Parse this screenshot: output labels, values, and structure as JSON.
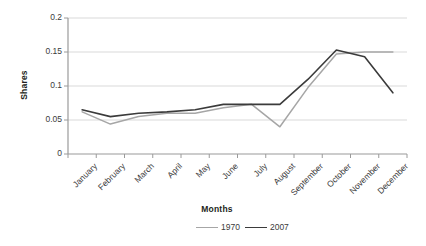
{
  "chart_data": {
    "type": "line",
    "title": "",
    "xlabel": "Months",
    "ylabel": "Shares",
    "categories": [
      "January",
      "February",
      "March",
      "April",
      "May",
      "June",
      "July",
      "August",
      "September",
      "October",
      "November",
      "December"
    ],
    "ylim": [
      0,
      0.2
    ],
    "yticks": [
      "0",
      "0.05",
      "0.1",
      "0.15",
      "0.2"
    ],
    "ytick_values": [
      0,
      0.05,
      0.1,
      0.15,
      0.2
    ],
    "grid": true,
    "legend_position": "bottom-right",
    "series": [
      {
        "name": "1970",
        "color": "#a6a6a6",
        "values": [
          0.062,
          0.044,
          0.055,
          0.06,
          0.06,
          0.068,
          0.073,
          0.04,
          0.098,
          0.147,
          0.15,
          0.15
        ]
      },
      {
        "name": "2007",
        "color": "#3b3b3b",
        "values": [
          0.065,
          0.055,
          0.06,
          0.062,
          0.065,
          0.073,
          0.073,
          0.073,
          0.11,
          0.153,
          0.143,
          0.09
        ]
      }
    ]
  },
  "axis": {
    "y_title": "Shares",
    "x_title": "Months"
  },
  "legend": {
    "items": [
      {
        "label": "1970",
        "color": "#a6a6a6"
      },
      {
        "label": "2007",
        "color": "#3b3b3b"
      }
    ]
  },
  "colors": {
    "gridline": "#d9d9d9",
    "axis": "#9a9a9a",
    "series_1970": "#a6a6a6",
    "series_2007": "#3b3b3b",
    "background": "#ffffff"
  }
}
